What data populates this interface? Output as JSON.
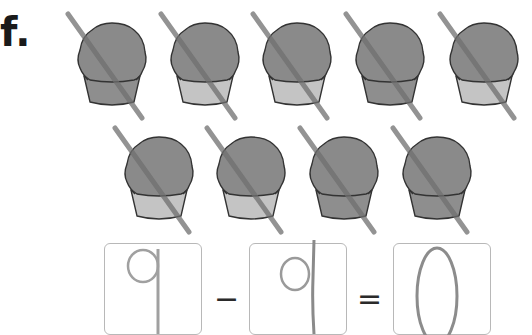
{
  "exercise": {
    "label": "f.",
    "object": "cupcake",
    "total_count": 9,
    "crossed_out_count": 9,
    "rows": [
      {
        "cupcakes": [
          {
            "crossed": true,
            "liner": "dark"
          },
          {
            "crossed": true,
            "liner": "light"
          },
          {
            "crossed": true,
            "liner": "light"
          },
          {
            "crossed": true,
            "liner": "dark"
          },
          {
            "crossed": true,
            "liner": "light"
          }
        ]
      },
      {
        "cupcakes": [
          {
            "crossed": true,
            "liner": "light"
          },
          {
            "crossed": true,
            "liner": "light"
          },
          {
            "crossed": true,
            "liner": "dark"
          },
          {
            "crossed": true,
            "liner": "dark"
          }
        ]
      }
    ]
  },
  "equation": {
    "minuend": "9",
    "operator": "−",
    "subtrahend": "9",
    "equals": "=",
    "result": "0"
  },
  "colors": {
    "frosting": "#8a8a8a",
    "liner_light": "#c4c4c4",
    "liner_dark": "#8e8e8e",
    "outline": "#333333",
    "strike": "#6f6f6f",
    "pencil": "#9a9a9a",
    "box_border": "#b8b8b8"
  }
}
